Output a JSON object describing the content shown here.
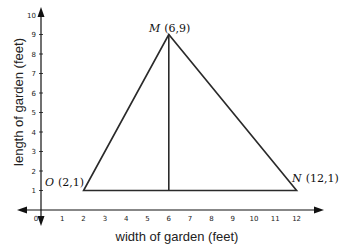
{
  "diagram": {
    "type": "coordinate-plane-triangle",
    "x_axis": {
      "label": "width of garden (feet)",
      "ticks": [
        "0",
        "1",
        "2",
        "3",
        "4",
        "5",
        "6",
        "7",
        "8",
        "9",
        "10",
        "11",
        "12"
      ],
      "min": 0,
      "max": 12
    },
    "y_axis": {
      "label": "length of garden (feet)",
      "ticks": [
        "1",
        "2",
        "3",
        "4",
        "5",
        "6",
        "7",
        "8",
        "9",
        "10"
      ],
      "min": 0,
      "max": 10
    },
    "points": [
      {
        "name": "O",
        "coords": "(2, 1)",
        "x": 2,
        "y": 1
      },
      {
        "name": "M",
        "coords": "(6, 9)",
        "x": 6,
        "y": 9
      },
      {
        "name": "N",
        "coords": "(12, 1)",
        "x": 12,
        "y": 1
      }
    ],
    "altitude": {
      "from": "M",
      "to_x": 6,
      "to_y": 1
    },
    "colors": {
      "line": "#2a2a2a",
      "axis": "#111111"
    }
  }
}
